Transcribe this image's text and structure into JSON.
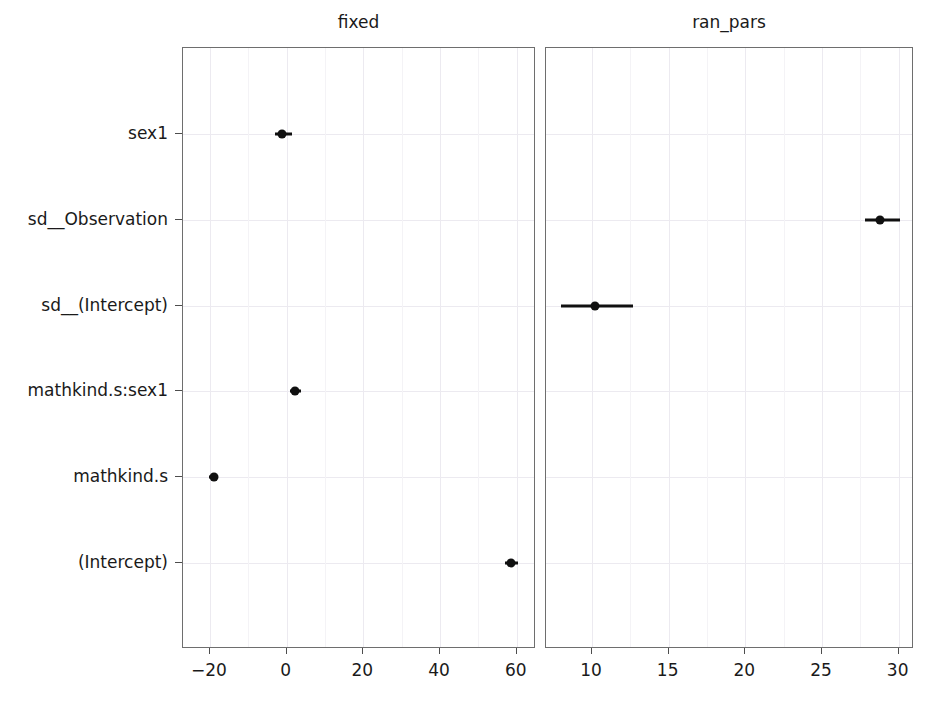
{
  "chart_data": {
    "type": "scatter",
    "title": "",
    "subtitle": "",
    "xlabel": "",
    "ylabel": "",
    "grid": true,
    "legend": null,
    "orientation": "horizontal",
    "categories": [
      "(Intercept)",
      "mathkind.s",
      "mathkind.s:sex1",
      "sd__(Intercept)",
      "sd__Observation",
      "sex1"
    ],
    "panels": [
      {
        "name": "fixed",
        "title": "fixed",
        "xlim": [
          -27.0,
          65.0
        ],
        "xticks": [
          -20,
          0,
          20,
          40,
          60
        ],
        "xticklabels": [
          "−20",
          "0",
          "20",
          "40",
          "60"
        ],
        "points": [
          {
            "term": "(Intercept)",
            "estimate": 58.5,
            "low": 56.8,
            "high": 60.3
          },
          {
            "term": "mathkind.s",
            "estimate": -19.0,
            "low": -20.1,
            "high": -17.9
          },
          {
            "term": "mathkind.s:sex1",
            "estimate": 2.3,
            "low": 0.8,
            "high": 3.8
          },
          {
            "term": "sex1",
            "estimate": -1.2,
            "low": -2.9,
            "high": 1.4
          }
        ]
      },
      {
        "name": "ran_pars",
        "title": "ran_pars",
        "xlim": [
          7.0,
          31.0
        ],
        "xticks": [
          10,
          15,
          20,
          25,
          30
        ],
        "xticklabels": [
          "10",
          "15",
          "20",
          "25",
          "30"
        ],
        "points": [
          {
            "term": "sd__(Intercept)",
            "estimate": 10.2,
            "low": 8.0,
            "high": 12.7
          },
          {
            "term": "sd__Observation",
            "estimate": 28.8,
            "low": 27.8,
            "high": 30.1
          }
        ]
      }
    ]
  },
  "style": {
    "point_color": "#101010",
    "bar_color": "#101010",
    "grid_color": "#eceaf0",
    "panel_border_color": "#6e6e6e",
    "text_color": "#1a1a1a",
    "background": "#ffffff"
  }
}
